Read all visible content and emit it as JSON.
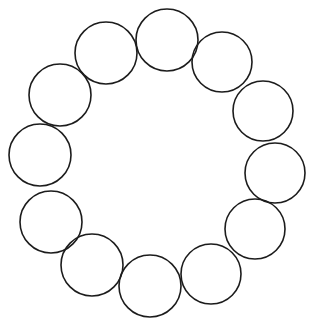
{
  "diagram": {
    "type": "ring-of-circles",
    "canvas": {
      "width": 315,
      "height": 329,
      "background": "#ffffff"
    },
    "stroke_color": "#1c1c1c",
    "circle_count": 12,
    "circles": [
      {
        "cx": 167,
        "cy": 40,
        "r": 31
      },
      {
        "cx": 106,
        "cy": 53,
        "r": 31
      },
      {
        "cx": 60,
        "cy": 95,
        "r": 31
      },
      {
        "cx": 40,
        "cy": 155,
        "r": 31
      },
      {
        "cx": 51,
        "cy": 222,
        "r": 31
      },
      {
        "cx": 92,
        "cy": 265,
        "r": 31
      },
      {
        "cx": 150,
        "cy": 286,
        "r": 31
      },
      {
        "cx": 211,
        "cy": 274,
        "r": 30
      },
      {
        "cx": 255,
        "cy": 229,
        "r": 30
      },
      {
        "cx": 275,
        "cy": 173,
        "r": 30
      },
      {
        "cx": 263,
        "cy": 111,
        "r": 30
      },
      {
        "cx": 222,
        "cy": 62,
        "r": 30
      }
    ]
  }
}
